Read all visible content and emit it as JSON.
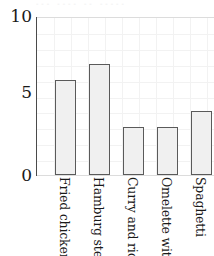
{
  "chart_data": {
    "type": "bar",
    "title": "",
    "subtitle": "",
    "xlabel": "",
    "ylabel": "",
    "categories": [
      "Fried chicken",
      "Hamburg steak",
      "Curry and rice",
      "Omelette with rice",
      "Spaghetti"
    ],
    "values": [
      6,
      7,
      3,
      3,
      4
    ],
    "ylim": [
      0,
      10
    ],
    "ytick_labels": [
      "10",
      "5",
      "0"
    ],
    "ytick_values": [
      10,
      5,
      0
    ],
    "grid": true,
    "legend": "none",
    "bar_fill_color": "#f0f0f0",
    "bar_border_color": "#5a5a5a",
    "axis_color": "#4a4a4a",
    "grid_color": "#f2f2f2",
    "text_color": "#1a1a1a",
    "background_color": "#ffffff",
    "x_tick_label_rotation": 90,
    "note": "plot area is cropped at the right edge of the screenshot"
  },
  "top_clip": {
    "text": "‑‑‑ ‑‑‑‑ ‑‑ ‑‑‑‑‑"
  }
}
